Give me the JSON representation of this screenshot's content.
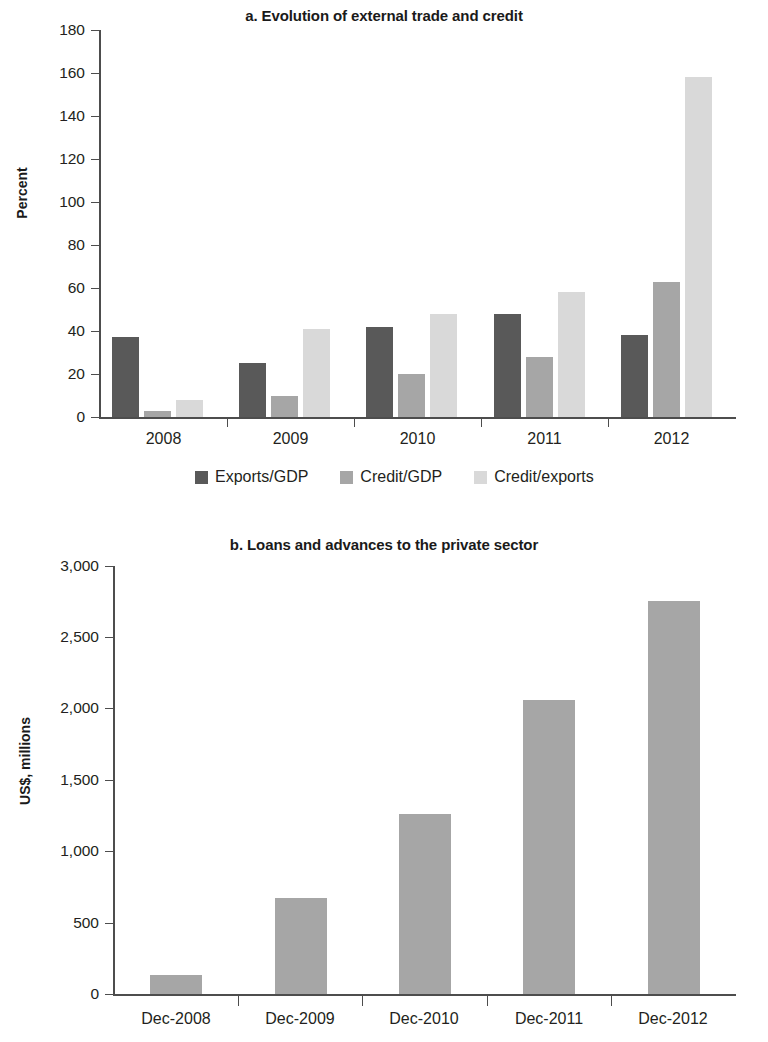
{
  "figure": {
    "panel_a": {
      "title": "a. Evolution of external trade and credit",
      "ylabel": "Percent",
      "y_ticks": [
        "0",
        "20",
        "40",
        "60",
        "80",
        "100",
        "120",
        "140",
        "160",
        "180"
      ],
      "x_ticks": [
        "2008",
        "2009",
        "2010",
        "2011",
        "2012"
      ],
      "legend": [
        {
          "label": "Exports/GDP",
          "color": "#595959"
        },
        {
          "label": "Credit/GDP",
          "color": "#a6a6a6"
        },
        {
          "label": "Credit/exports",
          "color": "#d9d9d9"
        }
      ]
    },
    "panel_b": {
      "title": "b. Loans and advances to the private sector",
      "ylabel": "US$, millions",
      "y_ticks": [
        "0",
        "500",
        "1,000",
        "1,500",
        "2,000",
        "2,500",
        "3,000"
      ],
      "x_ticks": [
        "Dec-2008",
        "Dec-2009",
        "Dec-2010",
        "Dec-2011",
        "Dec-2012"
      ],
      "bar_color": "#a6a6a6"
    }
  },
  "chart_data": [
    {
      "type": "bar",
      "title": "a. Evolution of external trade and credit",
      "xlabel": "",
      "ylabel": "Percent",
      "categories": [
        "2008",
        "2009",
        "2010",
        "2011",
        "2012"
      ],
      "series": [
        {
          "name": "Exports/GDP",
          "color": "#595959",
          "values": [
            37,
            25,
            42,
            48,
            38
          ]
        },
        {
          "name": "Credit/GDP",
          "color": "#a6a6a6",
          "values": [
            3,
            10,
            20,
            28,
            63
          ]
        },
        {
          "name": "Credit/exports",
          "color": "#d9d9d9",
          "values": [
            8,
            41,
            48,
            58,
            158
          ]
        }
      ],
      "ylim": [
        0,
        180
      ],
      "ytick_step": 20,
      "grid": false,
      "legend_position": "bottom"
    },
    {
      "type": "bar",
      "title": "b. Loans and advances to the private sector",
      "xlabel": "",
      "ylabel": "US$, millions",
      "categories": [
        "Dec-2008",
        "Dec-2009",
        "Dec-2010",
        "Dec-2011",
        "Dec-2012"
      ],
      "values": [
        130,
        670,
        1260,
        2060,
        2755
      ],
      "series": [
        {
          "name": "Loans and advances to the private sector",
          "color": "#a6a6a6",
          "values": [
            130,
            670,
            1260,
            2060,
            2755
          ]
        }
      ],
      "ylim": [
        0,
        3000
      ],
      "ytick_step": 500,
      "grid": false,
      "legend_position": "none"
    }
  ]
}
